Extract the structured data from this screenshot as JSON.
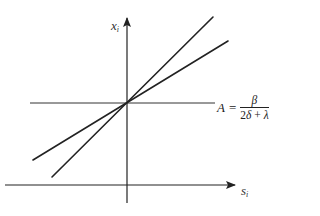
{
  "diagram": {
    "type": "line_diagram",
    "background": "#ffffff",
    "stroke_color": "#222222",
    "axes": {
      "vertical": {
        "label": "x",
        "label_sub": "i",
        "x": 127,
        "y_top": 18,
        "y_bottom": 203,
        "arrow": "up"
      },
      "horizontal": {
        "label": "s",
        "label_sub": "i",
        "y": 185,
        "x_left": 5,
        "x_right": 235,
        "arrow": "right"
      }
    },
    "reference_line": {
      "name": "A-level",
      "y": 103,
      "x_left": 30,
      "x_right": 215
    },
    "lines": [
      {
        "name": "steep-line",
        "x1": 52,
        "y1": 177,
        "x2": 213,
        "y2": 17
      },
      {
        "name": "flat-line",
        "x1": 33,
        "y1": 160,
        "x2": 228,
        "y2": 41
      }
    ],
    "intersection": {
      "x": 127,
      "y": 103
    },
    "formula": {
      "lhs": "A",
      "equals": "=",
      "numerator": "β",
      "denominator_prefix": "2",
      "denominator_delta": "δ",
      "denominator_plus": " + ",
      "denominator_lambda": "λ"
    }
  }
}
